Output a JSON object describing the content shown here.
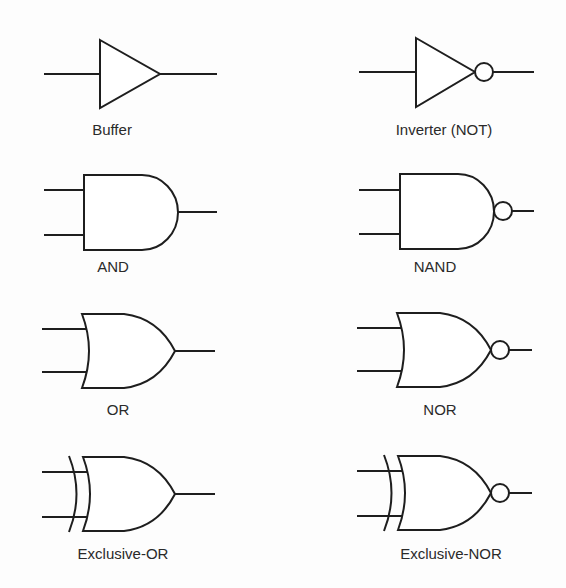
{
  "diagram": {
    "gates": [
      {
        "id": "buffer",
        "label": "Buffer"
      },
      {
        "id": "inverter",
        "label": "Inverter (NOT)"
      },
      {
        "id": "and",
        "label": "AND"
      },
      {
        "id": "nand",
        "label": "NAND"
      },
      {
        "id": "or",
        "label": "OR"
      },
      {
        "id": "nor",
        "label": "NOR"
      },
      {
        "id": "xor",
        "label": "Exclusive-OR"
      },
      {
        "id": "xnor",
        "label": "Exclusive-NOR"
      }
    ],
    "colors": {
      "stroke": "#1e1e1e",
      "text": "#2a2a2a",
      "background": "#fdfdfd"
    }
  }
}
